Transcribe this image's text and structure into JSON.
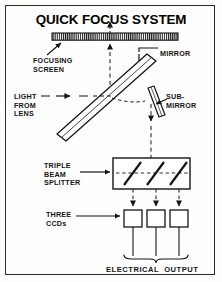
{
  "figure": {
    "title": "QUICK FOCUS SYSTEM",
    "type": "optical-path-schematic",
    "border_color": "#2b2b2b",
    "ink_color": "#151515",
    "background": "#fefefe"
  },
  "labels": {
    "focusing_screen": "FOCUSING\nSCREEN",
    "light_from_lens": "LIGHT\nFROM\nLENS",
    "mirror": "MIRROR",
    "sub_mirror": "SUB-\nMIRROR",
    "triple_beam_splitter": "TRIPLE\nBEAM\nSPLITTER",
    "three_ccds": "THREE\nCCDs",
    "electrical_output": "ELECTRICAL  OUTPUT"
  },
  "components": {
    "focusing_screen": {
      "kind": "hatched-bar",
      "x": 52,
      "y": 33,
      "width": 126,
      "height": 7,
      "stripes": 60
    },
    "main_mirror": {
      "kind": "tilted-slab",
      "angle_deg": -47,
      "from": [
        60,
        136
      ],
      "to": [
        152,
        58
      ]
    },
    "sub_mirror": {
      "kind": "tilted-slab",
      "angle_deg": 22,
      "from": [
        150,
        89
      ],
      "to": [
        161,
        117
      ]
    },
    "beam_splitter_box": {
      "kind": "rect",
      "x": 113,
      "y": 158,
      "width": 77,
      "height": 31,
      "internal_mirrors": 3
    },
    "ccds": [
      {
        "kind": "rect",
        "x": 124,
        "y": 210,
        "width": 18,
        "height": 17
      },
      {
        "kind": "rect",
        "x": 147,
        "y": 210,
        "width": 18,
        "height": 17
      },
      {
        "kind": "rect",
        "x": 170,
        "y": 210,
        "width": 18,
        "height": 17
      }
    ],
    "output_brace": {
      "kind": "curly-brace-down",
      "x": 124,
      "y": 256,
      "width": 64
    }
  },
  "beams": {
    "incoming_from_lens": {
      "style": "dashed-arrow",
      "direction": "right",
      "from": [
        38,
        96
      ],
      "to": [
        108,
        96
      ]
    },
    "up_to_focusing_screen": {
      "style": "dashed-arrow",
      "direction": "up",
      "from": [
        110,
        96
      ],
      "to": [
        110,
        40
      ]
    },
    "down_to_splitter": {
      "style": "dashed-arrow",
      "direction": "down",
      "from": [
        151,
        104
      ],
      "to": [
        151,
        158
      ]
    },
    "splitter_to_ccds": [
      {
        "style": "dashed-arrow",
        "direction": "down",
        "from": [
          133,
          189
        ],
        "to": [
          133,
          209
        ]
      },
      {
        "style": "dashed-arrow",
        "direction": "down",
        "from": [
          156,
          189
        ],
        "to": [
          156,
          209
        ]
      },
      {
        "style": "dashed-arrow",
        "direction": "down",
        "from": [
          179,
          189
        ],
        "to": [
          179,
          209
        ]
      }
    ],
    "ccd_leads": [
      {
        "style": "solid",
        "from": [
          133,
          227
        ],
        "to": [
          133,
          256
        ]
      },
      {
        "style": "solid",
        "from": [
          156,
          227
        ],
        "to": [
          156,
          256
        ]
      },
      {
        "style": "solid",
        "from": [
          179,
          227
        ],
        "to": [
          179,
          256
        ]
      }
    ]
  },
  "pointers": {
    "focusing_screen_arrow": {
      "style": "solid-arrow",
      "from": [
        47,
        56
      ],
      "to": [
        62,
        42
      ]
    },
    "mirror_arrow": {
      "style": "solid-elbow-arrow",
      "from": [
        158,
        54
      ],
      "to": [
        140,
        78
      ]
    },
    "sub_mirror_arrow": {
      "style": "solid-arrow",
      "from": [
        166,
        98
      ],
      "to": [
        154,
        104
      ]
    },
    "triple_splitter_arrow": {
      "style": "solid-arrow",
      "from": [
        80,
        172
      ],
      "to": [
        111,
        172
      ]
    },
    "three_ccds_arrow": {
      "style": "solid-arrow",
      "from": [
        76,
        216
      ],
      "to": [
        120,
        216
      ]
    }
  }
}
